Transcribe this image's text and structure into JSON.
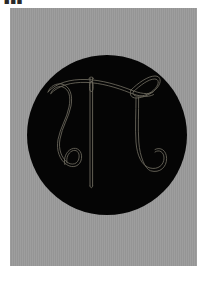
{
  "artwork": {
    "title_mark": "■■■",
    "medium_description": "line drawing on black circle",
    "canvas": {
      "width": 215,
      "height": 282,
      "background_color": "#ffffff"
    },
    "mount": {
      "label": "gray paper mount",
      "color": "#9a9a9a",
      "x": 10,
      "y": 8,
      "width": 187,
      "height": 258
    },
    "disc": {
      "label": "black circular field",
      "color": "#050505",
      "center_x": 107,
      "center_y": 135,
      "radius": 80
    },
    "drawing": {
      "label": "needle and thread forming pi",
      "stroke_color": "#6e6a5e",
      "stroke_width": 0.9,
      "elements": [
        {
          "name": "sewing-needle",
          "description": "vertical needle with eye near top"
        },
        {
          "name": "needle-eye",
          "description": "elongated oval eye"
        },
        {
          "name": "thread-left-stem",
          "description": "left descending stroke ending in hook"
        },
        {
          "name": "thread-right-stem",
          "description": "right descending stroke ending in hook"
        },
        {
          "name": "thread-crossbar",
          "description": "horizontal thread across the top"
        },
        {
          "name": "thread-loop",
          "description": "pointed oval loop at upper right"
        }
      ]
    }
  }
}
